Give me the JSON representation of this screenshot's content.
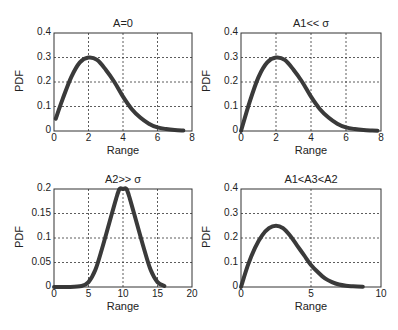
{
  "chart_data": [
    {
      "type": "line",
      "title": "A=0",
      "xlabel": "Range",
      "ylabel": "PDF",
      "xlim": [
        0,
        8
      ],
      "ylim": [
        0,
        0.4
      ],
      "xticks": [
        "0",
        "2",
        "4",
        "6",
        "8"
      ],
      "yticks": [
        "0",
        "0.1",
        "0.2",
        "0.3",
        "0.4"
      ],
      "grid": true,
      "x": [
        0.1,
        0.5,
        1.0,
        1.5,
        2.0,
        2.5,
        3.0,
        3.5,
        4.0,
        4.5,
        5.0,
        5.5,
        6.0,
        6.5,
        7.0,
        7.5
      ],
      "values": [
        0.05,
        0.13,
        0.22,
        0.28,
        0.3,
        0.29,
        0.25,
        0.2,
        0.14,
        0.09,
        0.055,
        0.03,
        0.015,
        0.008,
        0.004,
        0.002
      ]
    },
    {
      "type": "line",
      "title": "A1<< σ",
      "xlabel": "Range",
      "ylabel": "PDF",
      "xlim": [
        0,
        8
      ],
      "ylim": [
        0,
        0.4
      ],
      "xticks": [
        "0",
        "2",
        "4",
        "6",
        "8"
      ],
      "yticks": [
        "0",
        "0.1",
        "0.2",
        "0.3",
        "0.4"
      ],
      "grid": true,
      "x": [
        0.0,
        0.5,
        1.0,
        1.5,
        2.0,
        2.5,
        3.0,
        3.5,
        4.0,
        4.5,
        5.0,
        5.5,
        6.0,
        6.5,
        7.0,
        7.5,
        7.8
      ],
      "values": [
        0.0,
        0.12,
        0.22,
        0.28,
        0.3,
        0.29,
        0.25,
        0.2,
        0.14,
        0.09,
        0.055,
        0.03,
        0.015,
        0.008,
        0.004,
        0.002,
        0.001
      ]
    },
    {
      "type": "line",
      "title": "A2>> σ",
      "xlabel": "Range",
      "ylabel": "PDF",
      "xlim": [
        0,
        20
      ],
      "ylim": [
        0,
        0.2
      ],
      "xticks": [
        "0",
        "5",
        "10",
        "15",
        "20"
      ],
      "yticks": [
        "0",
        "0.05",
        "0.1",
        "0.15",
        "0.2"
      ],
      "grid": true,
      "x": [
        0,
        2,
        4,
        5,
        6,
        7,
        8,
        9,
        9.5,
        10,
        10.5,
        11,
        12,
        13,
        14,
        15,
        16
      ],
      "values": [
        0.0,
        0.0,
        0.002,
        0.01,
        0.035,
        0.08,
        0.13,
        0.18,
        0.2,
        0.2,
        0.2,
        0.18,
        0.13,
        0.08,
        0.035,
        0.01,
        0.002
      ]
    },
    {
      "type": "line",
      "title": "A1<A3<A2",
      "xlabel": "Range",
      "ylabel": "PDF",
      "xlim": [
        0,
        10
      ],
      "ylim": [
        0,
        0.4
      ],
      "xticks": [
        "0",
        "5",
        "10"
      ],
      "yticks": [
        "0",
        "0.1",
        "0.2",
        "0.3",
        "0.4"
      ],
      "grid": true,
      "x": [
        0.0,
        0.5,
        1.0,
        1.5,
        2.0,
        2.5,
        3.0,
        3.5,
        4.0,
        4.5,
        5.0,
        5.5,
        6.0,
        6.5,
        7.0,
        7.5,
        8.0,
        8.7
      ],
      "values": [
        0.0,
        0.09,
        0.16,
        0.21,
        0.24,
        0.25,
        0.24,
        0.21,
        0.17,
        0.13,
        0.09,
        0.06,
        0.035,
        0.02,
        0.01,
        0.005,
        0.003,
        0.001
      ]
    }
  ],
  "layout": {
    "panels": [
      {
        "left": 54,
        "top": 33,
        "width": 138,
        "height": 98
      },
      {
        "left": 241,
        "top": 33,
        "width": 140,
        "height": 98
      },
      {
        "left": 54,
        "top": 189,
        "width": 138,
        "height": 98
      },
      {
        "left": 241,
        "top": 189,
        "width": 140,
        "height": 98
      }
    ]
  }
}
